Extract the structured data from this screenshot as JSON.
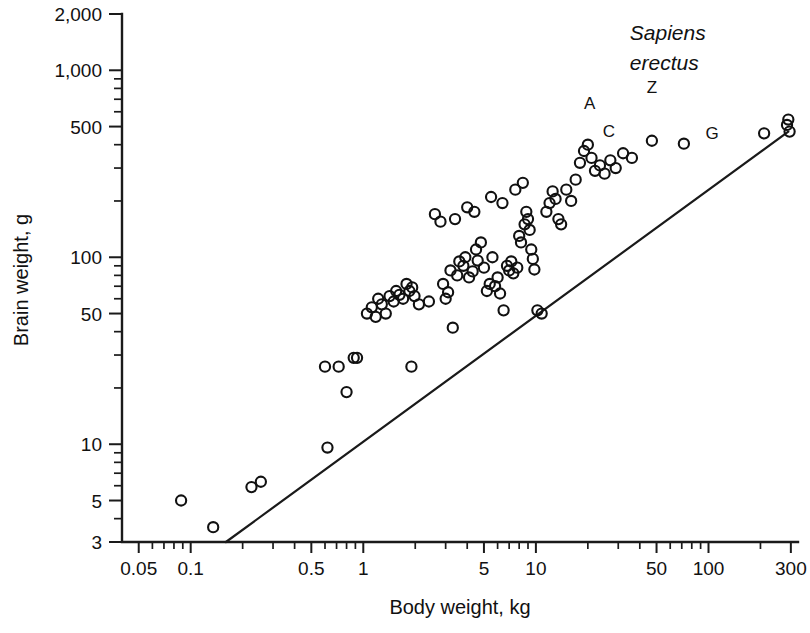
{
  "chart_data": {
    "type": "scatter",
    "title": "",
    "xlabel": "Body weight, kg",
    "ylabel": "Brain weight, g",
    "xscale": "log",
    "yscale": "log",
    "xlim": [
      0.04,
      330
    ],
    "ylim": [
      3,
      2000
    ],
    "grid": false,
    "legend_position": "none",
    "x_ticks_major": [
      0.05,
      0.1,
      0.5,
      1,
      5,
      10,
      50,
      100,
      300
    ],
    "x_tick_labels": [
      "0.05",
      "0.1",
      "0.5",
      "1",
      "5",
      "10",
      "50",
      "100",
      "300"
    ],
    "y_ticks_major": [
      3,
      5,
      10,
      50,
      100,
      500,
      1000,
      2000
    ],
    "y_tick_labels": [
      "3",
      "5",
      "10",
      "50",
      "100",
      "500",
      "1,000",
      "2,000"
    ],
    "x_ticks_minor": [
      0.06,
      0.07,
      0.08,
      0.09,
      0.2,
      0.3,
      0.4,
      0.6,
      0.7,
      0.8,
      0.9,
      2,
      3,
      4,
      6,
      7,
      8,
      9,
      20,
      30,
      40,
      60,
      70,
      80,
      90,
      200
    ],
    "y_ticks_minor": [
      4,
      6,
      7,
      8,
      9,
      20,
      30,
      40,
      60,
      70,
      80,
      90,
      200,
      300,
      400,
      600,
      700,
      800,
      900
    ],
    "reference_line": {
      "label": "allometric reference line",
      "x_start": 0.16,
      "y_start": 3.0,
      "x_end": 290,
      "y_end": 470
    },
    "annotations": [
      {
        "text": "Sapiens",
        "x": 35,
        "y": 1450
      },
      {
        "text": "erectus",
        "x": 35,
        "y": 1000
      },
      {
        "text": "A",
        "x": 20.5,
        "y": 620
      },
      {
        "text": "C",
        "x": 26.5,
        "y": 440
      },
      {
        "text": "Z",
        "x": 47,
        "y": 760
      },
      {
        "text": "G",
        "x": 105,
        "y": 430
      }
    ],
    "series": [
      {
        "name": "primate species",
        "marker": "open-circle",
        "points": [
          [
            0.088,
            5.0
          ],
          [
            0.135,
            3.6
          ],
          [
            0.225,
            5.9
          ],
          [
            0.255,
            6.3
          ],
          [
            0.62,
            9.6
          ],
          [
            0.6,
            26
          ],
          [
            0.72,
            26
          ],
          [
            0.8,
            19
          ],
          [
            0.88,
            29
          ],
          [
            0.92,
            29
          ],
          [
            1.9,
            26
          ],
          [
            1.05,
            50
          ],
          [
            1.12,
            54
          ],
          [
            1.18,
            48
          ],
          [
            1.22,
            60
          ],
          [
            1.28,
            56
          ],
          [
            1.35,
            50
          ],
          [
            1.42,
            62
          ],
          [
            1.5,
            58
          ],
          [
            1.55,
            66
          ],
          [
            1.62,
            63
          ],
          [
            1.7,
            60
          ],
          [
            1.78,
            72
          ],
          [
            1.85,
            66
          ],
          [
            1.92,
            69
          ],
          [
            1.98,
            62
          ],
          [
            2.1,
            56
          ],
          [
            2.4,
            58
          ],
          [
            2.9,
            72
          ],
          [
            3.0,
            60
          ],
          [
            3.1,
            65
          ],
          [
            3.2,
            85
          ],
          [
            3.3,
            42
          ],
          [
            3.5,
            80
          ],
          [
            3.6,
            95
          ],
          [
            3.8,
            90
          ],
          [
            3.9,
            100
          ],
          [
            4.1,
            78
          ],
          [
            4.3,
            84
          ],
          [
            4.5,
            110
          ],
          [
            4.6,
            96
          ],
          [
            4.8,
            120
          ],
          [
            5.0,
            88
          ],
          [
            5.2,
            66
          ],
          [
            5.4,
            72
          ],
          [
            5.6,
            100
          ],
          [
            5.8,
            70
          ],
          [
            6.0,
            78
          ],
          [
            6.2,
            64
          ],
          [
            6.5,
            52
          ],
          [
            6.8,
            90
          ],
          [
            7.0,
            85
          ],
          [
            7.2,
            95
          ],
          [
            7.4,
            82
          ],
          [
            7.8,
            88
          ],
          [
            8.0,
            130
          ],
          [
            8.2,
            120
          ],
          [
            8.6,
            150
          ],
          [
            8.8,
            175
          ],
          [
            9.0,
            160
          ],
          [
            9.2,
            140
          ],
          [
            9.4,
            110
          ],
          [
            9.6,
            98
          ],
          [
            9.8,
            86
          ],
          [
            10.2,
            52
          ],
          [
            10.8,
            50
          ],
          [
            2.6,
            170
          ],
          [
            2.8,
            155
          ],
          [
            3.4,
            160
          ],
          [
            4.0,
            185
          ],
          [
            4.4,
            175
          ],
          [
            5.5,
            210
          ],
          [
            6.4,
            195
          ],
          [
            7.6,
            230
          ],
          [
            8.4,
            250
          ],
          [
            11.5,
            175
          ],
          [
            12.0,
            195
          ],
          [
            12.5,
            225
          ],
          [
            13.0,
            205
          ],
          [
            13.5,
            160
          ],
          [
            14.0,
            150
          ],
          [
            15.0,
            230
          ],
          [
            16.0,
            200
          ],
          [
            17.0,
            260
          ],
          [
            18.0,
            320
          ],
          [
            19.0,
            370
          ],
          [
            20.0,
            400
          ],
          [
            21.0,
            340
          ],
          [
            22.0,
            290
          ],
          [
            23.5,
            310
          ],
          [
            25.0,
            280
          ],
          [
            27.0,
            330
          ],
          [
            29.0,
            300
          ],
          [
            32.0,
            360
          ],
          [
            36.0,
            340
          ],
          [
            47.0,
            420
          ],
          [
            72.0,
            405
          ],
          [
            210.0,
            460
          ],
          [
            285.0,
            510
          ],
          [
            290.0,
            545
          ],
          [
            295.0,
            470
          ]
        ]
      }
    ]
  },
  "geometry": {
    "plot_left": 122,
    "plot_bottom": 542,
    "plot_right": 798,
    "plot_top": 14
  }
}
